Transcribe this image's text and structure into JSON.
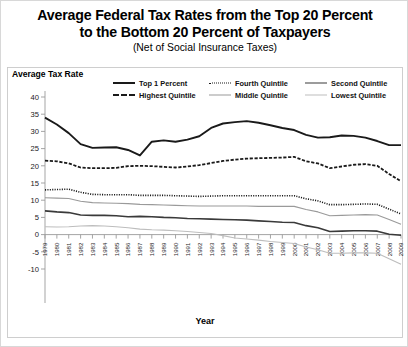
{
  "title": {
    "line1": "Average Federal Tax Rates from the Top 20 Percent",
    "line2": "to the Bottom 20 Percent of Taxpayers",
    "subtitle": "(Net of Social Insurance Taxes)"
  },
  "axes": {
    "y_title": "Average Tax Rate",
    "x_title": "Year"
  },
  "legend": {
    "items": [
      {
        "label": "Top 1 Percent",
        "style": "solid-thick",
        "color": "#1a1a1a"
      },
      {
        "label": "Fourth Quintile",
        "style": "dot",
        "color": "#1a1a1a"
      },
      {
        "label": "Second Quintile",
        "style": "solid-med",
        "color": "#3a3a3a"
      },
      {
        "label": "Highest Quintile",
        "style": "dash",
        "color": "#1a1a1a"
      },
      {
        "label": "Middle Quintile",
        "style": "thin-gray",
        "color": "#9a9a9a"
      },
      {
        "label": "Lowest Quintile",
        "style": "thin-lgray",
        "color": "#bdbdbd"
      }
    ]
  },
  "chart_data": {
    "type": "line",
    "title": "Average Federal Tax Rates from the Top 20 Percent to the Bottom 20 Percent of Taxpayers",
    "subtitle": "(Net of Social Insurance Taxes)",
    "xlabel": "Year",
    "ylabel": "Average Tax Rate",
    "ylim": [
      -10,
      40
    ],
    "yticks": [
      40,
      35,
      30,
      25,
      20,
      15,
      10,
      5,
      0,
      -5,
      -10
    ],
    "grid": false,
    "legend_position": "top",
    "x": [
      1979,
      1980,
      1981,
      1982,
      1983,
      1984,
      1985,
      1986,
      1987,
      1988,
      1989,
      1990,
      1991,
      1992,
      1993,
      1994,
      1995,
      1996,
      1997,
      1998,
      1999,
      2000,
      2001,
      2002,
      2003,
      2004,
      2005,
      2006,
      2007,
      2008,
      2009
    ],
    "series": [
      {
        "name": "Top 1 Percent",
        "style": "solid-thick",
        "color": "#1a1a1a",
        "values": [
          34.0,
          32.0,
          29.5,
          26.3,
          25.2,
          25.3,
          25.4,
          24.6,
          23.0,
          27.0,
          27.4,
          27.0,
          27.6,
          28.6,
          31.0,
          32.3,
          32.7,
          33.0,
          32.5,
          31.8,
          31.0,
          30.4,
          29.0,
          28.2,
          28.3,
          28.8,
          28.7,
          28.2,
          27.2,
          26.0,
          26.0
        ]
      },
      {
        "name": "Highest Quintile",
        "style": "dash",
        "color": "#1a1a1a",
        "values": [
          21.5,
          21.3,
          20.7,
          19.5,
          19.3,
          19.3,
          19.4,
          19.9,
          20.0,
          19.9,
          19.7,
          19.5,
          19.8,
          20.2,
          20.8,
          21.4,
          21.8,
          22.1,
          22.2,
          22.3,
          22.4,
          22.6,
          21.3,
          20.7,
          19.3,
          19.8,
          20.3,
          20.5,
          20.0,
          17.6,
          15.5
        ]
      },
      {
        "name": "Fourth Quintile",
        "style": "dot",
        "color": "#1a1a1a",
        "values": [
          13.0,
          13.1,
          13.2,
          12.3,
          11.7,
          11.6,
          11.6,
          11.6,
          11.4,
          11.4,
          11.4,
          11.3,
          11.2,
          11.1,
          11.2,
          11.3,
          11.3,
          11.3,
          11.3,
          11.3,
          11.3,
          11.3,
          10.4,
          9.8,
          8.7,
          8.7,
          8.8,
          8.9,
          8.8,
          7.4,
          6.0
        ]
      },
      {
        "name": "Middle Quintile",
        "style": "thin-gray",
        "color": "#9a9a9a",
        "values": [
          10.7,
          10.6,
          10.5,
          9.7,
          9.3,
          9.2,
          9.1,
          9.0,
          8.8,
          8.7,
          8.6,
          8.5,
          8.4,
          8.3,
          8.3,
          8.3,
          8.3,
          8.3,
          8.2,
          8.2,
          8.2,
          8.2,
          7.3,
          6.6,
          5.5,
          5.6,
          5.7,
          5.8,
          5.7,
          4.4,
          3.0
        ]
      },
      {
        "name": "Second Quintile",
        "style": "solid-med",
        "color": "#3a3a3a",
        "values": [
          6.9,
          6.6,
          6.4,
          5.7,
          5.6,
          5.6,
          5.5,
          5.2,
          5.3,
          5.2,
          5.0,
          4.9,
          4.7,
          4.6,
          4.5,
          4.4,
          4.3,
          4.2,
          4.0,
          3.8,
          3.6,
          3.5,
          2.6,
          2.0,
          0.9,
          1.0,
          1.1,
          1.1,
          1.0,
          0.1,
          -0.2
        ]
      },
      {
        "name": "Lowest Quintile",
        "style": "thin-lgray",
        "color": "#bdbdbd",
        "values": [
          2.3,
          2.2,
          2.3,
          2.5,
          2.6,
          2.5,
          2.3,
          2.0,
          1.6,
          1.4,
          1.3,
          1.1,
          0.9,
          0.6,
          0.3,
          -0.3,
          -1.0,
          -1.3,
          -1.6,
          -2.0,
          -2.3,
          -2.6,
          -3.6,
          -4.4,
          -5.4,
          -5.4,
          -5.3,
          -5.3,
          -5.4,
          -7.0,
          -8.6
        ]
      }
    ]
  }
}
